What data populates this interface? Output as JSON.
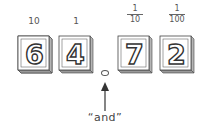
{
  "tiles": [
    {
      "digit": "6",
      "place_label": "10",
      "place_type": "whole"
    },
    {
      "digit": "4",
      "place_label": "1",
      "place_type": "whole"
    },
    {
      "digit": "7",
      "place_numerator": "1",
      "place_denominator": "10",
      "place_type": "fraction"
    },
    {
      "digit": "2",
      "place_numerator": "1",
      "place_denominator": "100",
      "place_type": "fraction"
    }
  ],
  "decimal_point": {
    "symbol": "."
  },
  "annotation": {
    "text": "“and”",
    "points_to": "decimal_point"
  },
  "colors": {
    "ink": "#3a3a3a",
    "tile_face": "#ffffff",
    "tile_shadow": "#8a8a8a",
    "background": "#ffffff"
  }
}
